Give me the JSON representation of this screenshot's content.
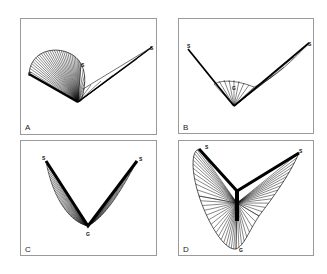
{
  "figure": {
    "panels": [
      {
        "id": "A",
        "label": "A",
        "markers": {
          "g": "G",
          "s1": "S",
          "s2": "S"
        }
      },
      {
        "id": "B",
        "label": "B",
        "markers": {
          "g": "G",
          "s1": "S",
          "s2": "S"
        }
      },
      {
        "id": "C",
        "label": "C",
        "markers": {
          "g": "G",
          "s1": "S",
          "s2": "S"
        }
      },
      {
        "id": "D",
        "label": "D",
        "markers": {
          "g": "G",
          "s1": "S",
          "s2": "S"
        }
      }
    ]
  }
}
